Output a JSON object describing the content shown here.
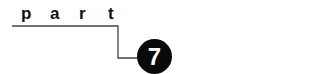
{
  "heading": {
    "letters": [
      "p",
      "a",
      "r",
      "t"
    ],
    "word": "part"
  },
  "badge": {
    "number": "7",
    "color": "#0a0a0a",
    "text_color": "#ffffff"
  },
  "line_color": "#444444"
}
